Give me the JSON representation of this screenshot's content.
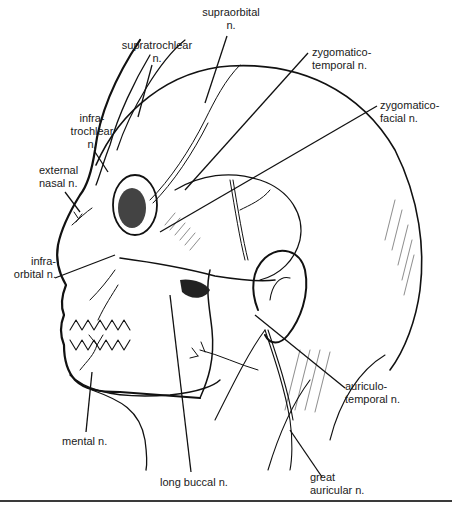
{
  "figure": {
    "labels": {
      "supraorbital": "supraorbital\nn.",
      "supratrochlear": "supratrochlear\nn.",
      "zygomaticotemporal": "zygomatico-\ntemporal n.",
      "zygomaticofacial": "zygomatico-\nfacial n.",
      "infratrochlear": "infra-\ntrochlear\nn.",
      "external_nasal": "external\nnasal n.",
      "infraorbital": "infra-\norbital n.",
      "auriculotemporal": "auriculo-\ntemporal n.",
      "mental": "mental n.",
      "long_buccal": "long buccal n.",
      "great_auricular": "great\nauricular n."
    },
    "colors": {
      "ink": "#111111",
      "paper": "#ffffff"
    }
  }
}
